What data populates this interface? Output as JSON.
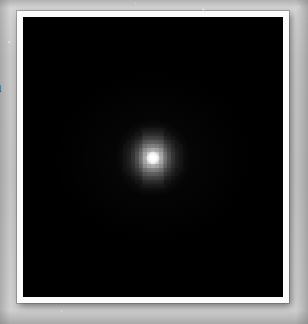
{
  "page": {
    "background_color": "#c9c9c9",
    "margin_text": "n"
  },
  "figure": {
    "mount_color": "#fbfbfb",
    "image_background_color": "#000000",
    "source_color": "#ffffff"
  },
  "chart_data": {
    "type": "heatmap",
    "title": "",
    "subtitle": "",
    "xlabel": "",
    "ylabel": "",
    "colormap": "grayscale",
    "grid": false,
    "legend": "none",
    "x": [
      -7,
      -6,
      -5,
      -4,
      -3,
      -2,
      -1,
      0,
      1,
      2,
      3,
      4,
      5,
      6,
      7
    ],
    "y": [
      -7,
      -6,
      -5,
      -4,
      -3,
      -2,
      -1,
      0,
      1,
      2,
      3,
      4,
      5,
      6,
      7
    ],
    "xlim": [
      -7.5,
      7.5
    ],
    "ylim": [
      -7.5,
      7.5
    ],
    "zlim": [
      0,
      1
    ],
    "values": [
      [
        0.0,
        0.0,
        0.0,
        0.0,
        0.01,
        0.01,
        0.01,
        0.01,
        0.01,
        0.01,
        0.01,
        0.0,
        0.0,
        0.0,
        0.0
      ],
      [
        0.0,
        0.0,
        0.0,
        0.01,
        0.01,
        0.02,
        0.02,
        0.02,
        0.02,
        0.02,
        0.01,
        0.01,
        0.0,
        0.0,
        0.0
      ],
      [
        0.0,
        0.0,
        0.01,
        0.02,
        0.03,
        0.04,
        0.05,
        0.05,
        0.05,
        0.04,
        0.03,
        0.02,
        0.01,
        0.0,
        0.0
      ],
      [
        0.0,
        0.01,
        0.02,
        0.04,
        0.06,
        0.09,
        0.11,
        0.12,
        0.11,
        0.09,
        0.06,
        0.04,
        0.02,
        0.01,
        0.0
      ],
      [
        0.01,
        0.01,
        0.03,
        0.06,
        0.11,
        0.17,
        0.22,
        0.24,
        0.22,
        0.17,
        0.11,
        0.06,
        0.03,
        0.01,
        0.01
      ],
      [
        0.01,
        0.02,
        0.04,
        0.09,
        0.17,
        0.29,
        0.39,
        0.43,
        0.39,
        0.29,
        0.17,
        0.09,
        0.04,
        0.02,
        0.01
      ],
      [
        0.01,
        0.02,
        0.05,
        0.11,
        0.22,
        0.39,
        0.58,
        0.66,
        0.58,
        0.39,
        0.22,
        0.11,
        0.05,
        0.02,
        0.01
      ],
      [
        0.01,
        0.02,
        0.05,
        0.12,
        0.24,
        0.43,
        0.66,
        1.0,
        0.66,
        0.43,
        0.24,
        0.12,
        0.05,
        0.02,
        0.01
      ],
      [
        0.01,
        0.02,
        0.05,
        0.11,
        0.22,
        0.39,
        0.58,
        0.66,
        0.58,
        0.39,
        0.22,
        0.11,
        0.05,
        0.02,
        0.01
      ],
      [
        0.01,
        0.02,
        0.04,
        0.09,
        0.17,
        0.29,
        0.39,
        0.43,
        0.39,
        0.29,
        0.17,
        0.09,
        0.04,
        0.02,
        0.01
      ],
      [
        0.01,
        0.01,
        0.03,
        0.06,
        0.11,
        0.17,
        0.22,
        0.24,
        0.22,
        0.17,
        0.11,
        0.06,
        0.03,
        0.01,
        0.01
      ],
      [
        0.0,
        0.01,
        0.02,
        0.04,
        0.06,
        0.09,
        0.11,
        0.12,
        0.11,
        0.09,
        0.06,
        0.04,
        0.02,
        0.01,
        0.0
      ],
      [
        0.0,
        0.0,
        0.01,
        0.02,
        0.03,
        0.04,
        0.05,
        0.05,
        0.05,
        0.04,
        0.03,
        0.02,
        0.01,
        0.0,
        0.0
      ],
      [
        0.0,
        0.0,
        0.0,
        0.01,
        0.01,
        0.02,
        0.02,
        0.02,
        0.02,
        0.02,
        0.01,
        0.01,
        0.0,
        0.0,
        0.0
      ],
      [
        0.0,
        0.0,
        0.0,
        0.0,
        0.01,
        0.01,
        0.01,
        0.01,
        0.01,
        0.01,
        0.01,
        0.0,
        0.0,
        0.0,
        0.0
      ]
    ]
  }
}
